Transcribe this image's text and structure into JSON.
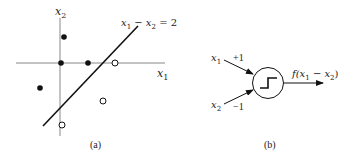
{
  "panel_a": {
    "caption": "(a)",
    "x_axis_label": "x",
    "x_axis_sub": "1",
    "y_axis_label": "x",
    "y_axis_sub": "2",
    "line_label_x1": "x",
    "line_label_sub1": "1",
    "line_label_minus": " − ",
    "line_label_x2": "x",
    "line_label_sub2": "2",
    "line_label_rhs": " = 2",
    "filled_points": [
      [
        61,
        37
      ],
      [
        61,
        63
      ],
      [
        88,
        63
      ],
      [
        39,
        88
      ]
    ],
    "open_points": [
      [
        115,
        63
      ],
      [
        103,
        101
      ],
      [
        62,
        125
      ]
    ],
    "colors": {
      "axis": "#888888",
      "line": "#111111",
      "point": "#111111"
    }
  },
  "panel_b": {
    "caption": "(b)",
    "input1_label": "x",
    "input1_sub": "1",
    "input1_weight": "+1",
    "input2_label": "x",
    "input2_sub": "2",
    "input2_weight": "−1",
    "output_f": "f(x",
    "output_sub1": "1",
    "output_minus": " − x",
    "output_sub2": "2",
    "output_close": ")",
    "node_icon": "step-function-icon"
  }
}
